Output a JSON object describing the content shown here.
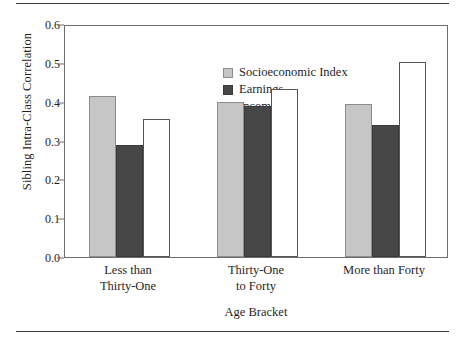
{
  "figure": {
    "rules": {
      "top_label": "top-rule",
      "bottom_label": "bottom-rule"
    }
  },
  "chart_data": {
    "type": "bar",
    "title": "",
    "xlabel": "Age Bracket",
    "ylabel": "Sibling Intra-Class Correlation",
    "categories": [
      "Less than\nThirty-One",
      "Thirty-One\nto Forty",
      "More than Forty"
    ],
    "category_lines": [
      [
        "Less than",
        "Thirty-One"
      ],
      [
        "Thirty-One",
        "to Forty"
      ],
      [
        "More than Forty"
      ]
    ],
    "series": [
      {
        "name": "Socioeconomic Index",
        "color": "#c6c6c6",
        "edge": "#8d8d8d",
        "values": [
          0.415,
          0.4,
          0.395
        ]
      },
      {
        "name": "Earnings",
        "color": "#474747",
        "edge": "#3a3a3a",
        "values": [
          0.289,
          0.389,
          0.339
        ]
      },
      {
        "name": "Income",
        "color": "#ffffff",
        "edge": "#555555",
        "values": [
          0.356,
          0.432,
          0.501
        ]
      }
    ],
    "ylim": [
      0.0,
      0.6
    ],
    "ytick_values": [
      0.0,
      0.1,
      0.2,
      0.3,
      0.4,
      0.5,
      0.6
    ],
    "ytick_labels": [
      "0.0",
      "0.1",
      "0.2",
      "0.3",
      "0.4",
      "0.5",
      "0.6"
    ],
    "grid": false,
    "legend_position": "upper-center-left"
  }
}
